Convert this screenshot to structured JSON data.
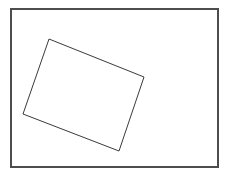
{
  "figure": {
    "title": "",
    "background_color": "#ffffff",
    "width": 229,
    "height": 178,
    "outer_frame": {
      "name": "outer-rectangle",
      "stroke_color": "#4d4d4d",
      "stroke_width": 1.1,
      "fill": "none",
      "x": 11,
      "y": 9,
      "width": 207,
      "height": 158,
      "corners": [
        {
          "label": "top-left",
          "x": 11,
          "y": 9
        },
        {
          "label": "top-right",
          "x": 218,
          "y": 9
        },
        {
          "label": "bottom-right",
          "x": 218,
          "y": 167
        },
        {
          "label": "bottom-left",
          "x": 11,
          "y": 167
        }
      ]
    },
    "inner_shape": {
      "name": "rotated-rectangle",
      "stroke_color": "#3a3a3a",
      "stroke_width": 1.0,
      "fill": "none",
      "rotation_degrees": 21.8,
      "points": "49,39 144,77 119,151 23,114",
      "corners": [
        {
          "label": "top",
          "x": 49,
          "y": 39
        },
        {
          "label": "right",
          "x": 144,
          "y": 77
        },
        {
          "label": "bottom",
          "x": 119,
          "y": 151
        },
        {
          "label": "left",
          "x": 23,
          "y": 114
        }
      ]
    }
  }
}
